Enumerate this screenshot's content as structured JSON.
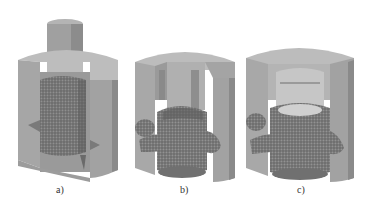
{
  "figure": {
    "panels": [
      {
        "id": "a",
        "label": "a)",
        "description": "Die cross-section with punch and cylindrical meshed billet"
      },
      {
        "id": "b",
        "label": "b)",
        "description": "Die cross-section with partially formed meshed workpiece with branches"
      },
      {
        "id": "c",
        "label": "c)",
        "description": "Die cross-section with fully formed meshed workpiece with branches and hollow top"
      }
    ],
    "colors": {
      "background": "#ffffff",
      "die": "#a8a8a8",
      "die_dark": "#8a8a8a",
      "die_light": "#c4c4c4",
      "mesh": "#6e6e6e",
      "mesh_dark": "#555555",
      "caption": "#333333"
    }
  }
}
